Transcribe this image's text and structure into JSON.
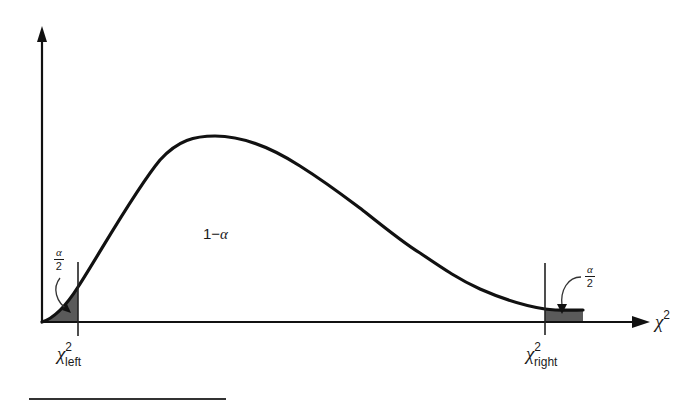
{
  "diagram": {
    "center_label": {
      "prefix": "1−",
      "symbol": "α"
    },
    "x_axis_label": {
      "base": "χ",
      "sup": "2"
    },
    "left_critical": {
      "base": "χ",
      "sup": "2",
      "sub": "left"
    },
    "right_critical": {
      "base": "χ",
      "sup": "2",
      "sub": "right"
    },
    "left_tail_fraction": {
      "numerator": "α",
      "denominator": "2"
    },
    "right_tail_fraction": {
      "numerator": "α",
      "denominator": "2"
    },
    "colors": {
      "stroke": "#111111",
      "shade": "#5a5a5a",
      "background": "#ffffff"
    }
  }
}
